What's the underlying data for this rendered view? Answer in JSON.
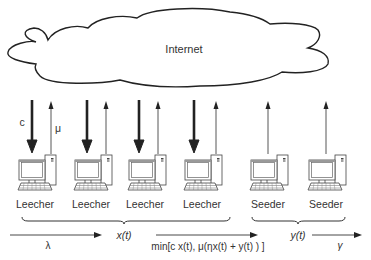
{
  "cloud": {
    "label": "Internet"
  },
  "rates": {
    "download_label": "c",
    "upload_label": "μ"
  },
  "peers": [
    {
      "label": "Leecher",
      "type": "leecher",
      "x": 35
    },
    {
      "label": "Leecher",
      "type": "leecher",
      "x": 90
    },
    {
      "label": "Leecher",
      "type": "leecher",
      "x": 145
    },
    {
      "label": "Leecher",
      "type": "leecher",
      "x": 202
    },
    {
      "label": "Seeder",
      "type": "seeder",
      "x": 267
    },
    {
      "label": "Seeder",
      "type": "seeder",
      "x": 324
    }
  ],
  "flow": {
    "arrival_rate": "λ",
    "leecher_count": "x(t)",
    "completion_rate": "min[c x(t), μ(ηx(t) + y(t) ) ]",
    "seeder_count": "y(t)",
    "departure_rate": "γ"
  },
  "colors": {
    "stroke": "#222222",
    "text": "#333333",
    "background": "#ffffff"
  }
}
